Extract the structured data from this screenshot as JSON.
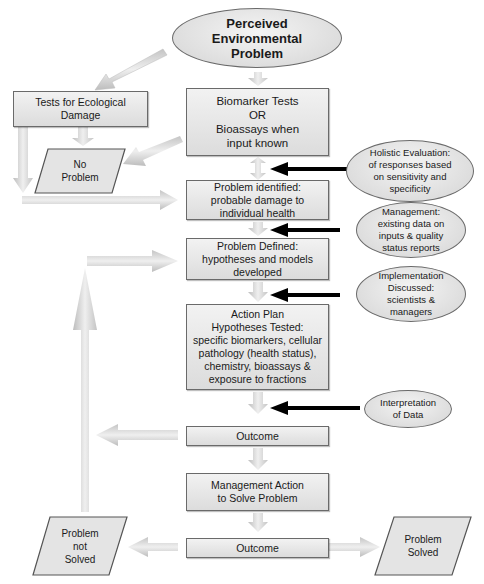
{
  "diagram": {
    "start": {
      "lines": [
        "Perceived",
        "Environmental",
        "Problem"
      ]
    },
    "ecological_tests": {
      "lines": [
        "Tests for Ecological",
        "Damage"
      ]
    },
    "no_problem": {
      "lines": [
        "No",
        "Problem"
      ]
    },
    "biomarker_tests": {
      "lines": [
        "Biomarker Tests",
        "OR",
        "Bioassays when",
        "input known"
      ]
    },
    "problem_identified": {
      "lines": [
        "Problem identified:",
        "probable damage to",
        "individual health"
      ]
    },
    "problem_defined": {
      "lines": [
        "Problem Defined:",
        "hypotheses and models",
        "developed"
      ]
    },
    "action_plan": {
      "lines": [
        "Action Plan",
        "Hypotheses Tested:",
        "specific biomarkers, cellular",
        "pathology (health status),",
        "chemistry, bioassays &",
        "exposure to fractions"
      ]
    },
    "outcome_1": {
      "lines": [
        "Outcome"
      ]
    },
    "management_action": {
      "lines": [
        "Management Action",
        "to Solve Problem"
      ]
    },
    "outcome_2": {
      "lines": [
        "Outcome"
      ]
    },
    "problem_not_solved": {
      "lines": [
        "Problem",
        "not",
        "Solved"
      ]
    },
    "problem_solved": {
      "lines": [
        "Problem",
        "Solved"
      ]
    },
    "side_inputs": {
      "holistic_evaluation": {
        "lines": [
          "Holistic Evaluation:",
          "of responses based",
          "on sensitivity and",
          "specificity"
        ]
      },
      "management_data": {
        "lines": [
          "Management:",
          "existing data on",
          "inputs & quality",
          "status reports"
        ]
      },
      "implementation": {
        "lines": [
          "Implementation",
          "Discussed:",
          "scientists &",
          "managers"
        ]
      },
      "interpretation": {
        "lines": [
          "Interpretation",
          "of Data"
        ]
      }
    }
  },
  "colors": {
    "box_fill": "#e6e6e6",
    "border": "#6a6a6a",
    "flow_arrow": "#cfcfcf",
    "input_arrow": "#000000"
  }
}
